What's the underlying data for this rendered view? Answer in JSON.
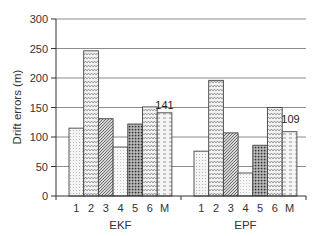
{
  "chart_data": {
    "type": "bar",
    "title": "",
    "xlabel": "",
    "ylabel": "Drift errors (m)",
    "ylim": [
      0,
      300
    ],
    "yticks": [
      0,
      50,
      100,
      150,
      200,
      250,
      300
    ],
    "grid": true,
    "legend": null,
    "groups": [
      "EKF",
      "EPF"
    ],
    "categories": [
      "1",
      "2",
      "3",
      "4",
      "5",
      "6",
      "M"
    ],
    "series": [
      {
        "name": "EKF",
        "values": [
          115,
          246,
          131,
          83,
          122,
          151,
          141
        ]
      },
      {
        "name": "EPF",
        "values": [
          76,
          196,
          107,
          39,
          86,
          150,
          109
        ]
      }
    ],
    "annotations": [
      {
        "group": "EKF",
        "category": "M",
        "text": "141"
      },
      {
        "group": "EPF",
        "category": "M",
        "text": "109"
      }
    ],
    "bar_patterns": [
      "fine-dots",
      "zigzag",
      "diagonal-hatch",
      "light-dots",
      "dense-dots",
      "zigzag",
      "dashes"
    ]
  }
}
